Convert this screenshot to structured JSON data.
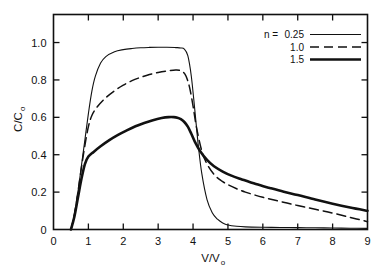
{
  "chart_data": {
    "type": "line",
    "title": "",
    "xlabel": "V/Vo",
    "xlabel_main": "V/V",
    "xlabel_sub": "o",
    "ylabel": "C/Co",
    "ylabel_main": "C/C",
    "ylabel_sub": "o",
    "xlim": [
      0,
      9
    ],
    "ylim": [
      0,
      1.15
    ],
    "xticks": [
      0,
      1,
      2,
      3,
      4,
      5,
      6,
      7,
      8,
      9
    ],
    "xtick_labels": [
      "0",
      "1",
      "2",
      "3",
      "4",
      "5",
      "6",
      "7",
      "8",
      "9"
    ],
    "yticks": [
      0,
      0.2,
      0.4,
      0.6,
      0.8,
      1.0
    ],
    "ytick_labels": [
      "0",
      "0.2",
      "0.4",
      "0.6",
      "0.8",
      "1.0"
    ],
    "grid": false,
    "legend_position": "top-right",
    "legend_prefix": "n =",
    "series": [
      {
        "name": "0.25",
        "label": "0.25",
        "style": "thin-solid",
        "stroke_width": 1.1,
        "dash": "none",
        "color": "#111111",
        "x": [
          0.5,
          0.6,
          0.7,
          0.8,
          0.9,
          1.0,
          1.1,
          1.2,
          1.35,
          1.5,
          1.75,
          2.0,
          2.25,
          2.5,
          2.75,
          3.0,
          3.25,
          3.5,
          3.65,
          3.75,
          3.85,
          3.95,
          4.05,
          4.15,
          4.25,
          4.4,
          4.55,
          4.7,
          4.85,
          5.0,
          5.25,
          5.5,
          6.0,
          6.5,
          7.0,
          7.5,
          8.0,
          8.5,
          9.0
        ],
        "y": [
          0.0,
          0.08,
          0.2,
          0.34,
          0.48,
          0.62,
          0.74,
          0.82,
          0.89,
          0.925,
          0.951,
          0.962,
          0.968,
          0.972,
          0.974,
          0.975,
          0.975,
          0.973,
          0.971,
          0.965,
          0.93,
          0.82,
          0.64,
          0.45,
          0.3,
          0.16,
          0.09,
          0.055,
          0.035,
          0.024,
          0.017,
          0.014,
          0.012,
          0.011,
          0.01,
          0.009,
          0.008,
          0.007,
          0.006
        ]
      },
      {
        "name": "1.0",
        "label": "1.0",
        "style": "dashed",
        "stroke_width": 1.5,
        "dash": "9,5",
        "color": "#111111",
        "x": [
          0.5,
          0.6,
          0.7,
          0.8,
          0.9,
          1.0,
          1.1,
          1.25,
          1.5,
          1.75,
          2.0,
          2.25,
          2.5,
          2.75,
          3.0,
          3.25,
          3.5,
          3.6,
          3.7,
          3.8,
          3.9,
          4.0,
          4.1,
          4.25,
          4.4,
          4.6,
          4.8,
          5.0,
          5.25,
          5.5,
          6.0,
          6.5,
          7.0,
          7.5,
          8.0,
          8.5,
          9.0
        ],
        "y": [
          0.0,
          0.08,
          0.2,
          0.33,
          0.45,
          0.55,
          0.61,
          0.655,
          0.705,
          0.742,
          0.772,
          0.796,
          0.814,
          0.829,
          0.84,
          0.848,
          0.853,
          0.852,
          0.845,
          0.82,
          0.76,
          0.66,
          0.545,
          0.42,
          0.35,
          0.295,
          0.262,
          0.24,
          0.218,
          0.2,
          0.172,
          0.15,
          0.128,
          0.108,
          0.088,
          0.065,
          0.042
        ]
      },
      {
        "name": "1.5",
        "label": "1.5",
        "style": "thick-solid",
        "stroke_width": 2.6,
        "dash": "none",
        "color": "#111111",
        "x": [
          0.5,
          0.6,
          0.7,
          0.8,
          0.9,
          1.0,
          1.15,
          1.35,
          1.6,
          1.85,
          2.1,
          2.35,
          2.6,
          2.85,
          3.1,
          3.3,
          3.45,
          3.55,
          3.65,
          3.75,
          3.85,
          3.95,
          4.05,
          4.2,
          4.4,
          4.6,
          4.85,
          5.1,
          5.4,
          5.8,
          6.2,
          6.6,
          7.0,
          7.5,
          8.0,
          8.5,
          9.0
        ],
        "y": [
          0.0,
          0.07,
          0.17,
          0.27,
          0.35,
          0.39,
          0.415,
          0.445,
          0.478,
          0.506,
          0.53,
          0.552,
          0.57,
          0.585,
          0.596,
          0.601,
          0.601,
          0.598,
          0.59,
          0.575,
          0.55,
          0.512,
          0.47,
          0.42,
          0.372,
          0.338,
          0.31,
          0.288,
          0.268,
          0.243,
          0.222,
          0.202,
          0.184,
          0.16,
          0.138,
          0.118,
          0.1
        ]
      }
    ]
  },
  "legend": {
    "prefix": "n =",
    "entries": [
      {
        "label": "0.25"
      },
      {
        "label": "1.0"
      },
      {
        "label": "1.5"
      }
    ]
  },
  "colors": {
    "background": "#ffffff",
    "ink": "#111111"
  }
}
